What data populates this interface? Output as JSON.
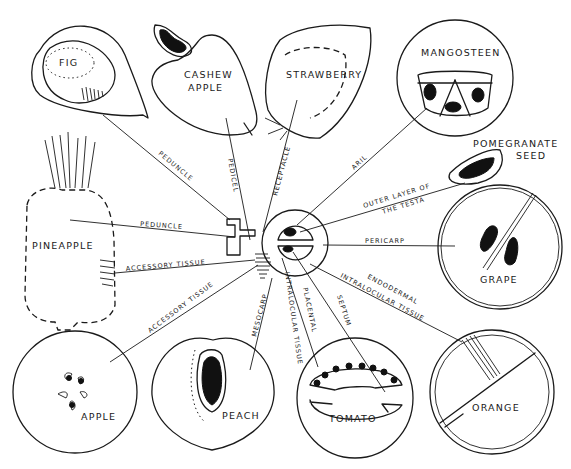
{
  "diagram": {
    "center_structure": "flower-ovary-cross-section",
    "fruits": [
      {
        "id": "fig",
        "label": "FIG",
        "tissue": "PEDUNCLE"
      },
      {
        "id": "cashew",
        "label_line1": "CASHEW",
        "label_line2": "APPLE",
        "tissue": "PEDICEL"
      },
      {
        "id": "strawberry",
        "label": "STRAWBERRY",
        "tissue": "RECEPTACLE"
      },
      {
        "id": "mangosteen",
        "label": "MANGOSTEEN",
        "tissue": "ARIL"
      },
      {
        "id": "pomegranate",
        "label_line1": "POMEGRANATE",
        "label_line2": "SEED",
        "tissue_line1": "OUTER LAYER OF",
        "tissue_line2": "THE TESTA"
      },
      {
        "id": "grape",
        "label": "GRAPE",
        "tissue": "PERICARP"
      },
      {
        "id": "orange",
        "label": "ORANGE",
        "tissue_line1": "ENDODERMAL",
        "tissue_line2": "INTRALOCULAR TISSUE"
      },
      {
        "id": "tomato",
        "label": "TOMATO",
        "tissues": [
          "SEPTUM",
          "PLACENTAL",
          "INTRALOCULAR TISSUE"
        ]
      },
      {
        "id": "peach",
        "label": "PEACH",
        "tissue": "MESOCARP"
      },
      {
        "id": "apple",
        "label": "APPLE",
        "tissue": "ACCESSORY TISSUE"
      },
      {
        "id": "pineapple",
        "label": "PINEAPPLE",
        "tissues": [
          "PEDUNCLE",
          "ACCESSORY TISSUE"
        ]
      }
    ]
  }
}
